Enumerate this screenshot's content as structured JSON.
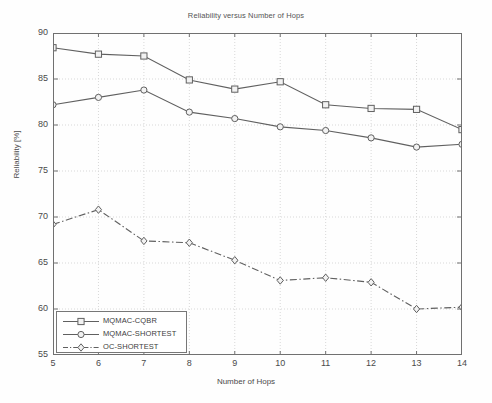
{
  "chart_data": {
    "type": "line",
    "title": "Reliability versus Number of Hops",
    "xlabel": "Number of Hops",
    "ylabel": "Reliability [%]",
    "xlim": [
      5,
      14
    ],
    "ylim": [
      55,
      90
    ],
    "xticks": [
      5,
      6,
      7,
      8,
      9,
      10,
      11,
      12,
      13,
      14
    ],
    "yticks": [
      55,
      60,
      65,
      70,
      75,
      80,
      85,
      90
    ],
    "grid": true,
    "legend_position": "lower-left",
    "x": [
      5,
      6,
      7,
      8,
      9,
      10,
      11,
      12,
      13,
      14
    ],
    "series": [
      {
        "name": "MQMAC-CQBR",
        "marker": "square",
        "linestyle": "solid",
        "color": "#606060",
        "values": [
          88.4,
          87.7,
          87.5,
          84.9,
          83.9,
          84.7,
          82.2,
          81.8,
          81.7,
          79.5
        ]
      },
      {
        "name": "MQMAC-SHORTEST",
        "marker": "circle",
        "linestyle": "solid",
        "color": "#606060",
        "values": [
          82.2,
          83.0,
          83.8,
          81.4,
          80.7,
          79.8,
          79.4,
          78.6,
          77.6,
          77.9
        ]
      },
      {
        "name": "OC-SHORTEST",
        "marker": "diamond",
        "linestyle": "dashdot",
        "color": "#606060",
        "values": [
          69.2,
          70.8,
          67.4,
          67.2,
          65.3,
          63.1,
          63.4,
          62.9,
          60.0,
          60.2
        ]
      }
    ]
  },
  "colors": {
    "axis": "#707070",
    "grid": "#d8d8d8",
    "line": "#606060",
    "marker_face": "#f2f2f2",
    "text": "#4a4a4a",
    "background": "#fefefe"
  }
}
